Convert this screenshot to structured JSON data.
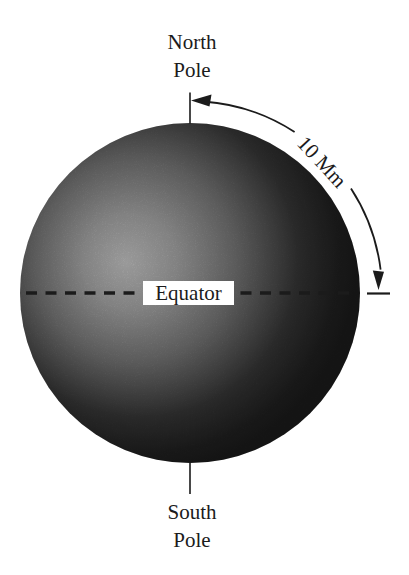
{
  "labels": {
    "north_pole_line1": "North",
    "north_pole_line2": "Pole",
    "south_pole_line1": "South",
    "south_pole_line2": "Pole",
    "equator": "Equator",
    "arc_distance": "10 Mm"
  },
  "colors": {
    "background": "#ffffff",
    "ink": "#1b1b1b",
    "equator_label_box": "#ffffff",
    "sphere_highlight": "#b4b4b4",
    "sphere_mid": "#6a6a6a",
    "sphere_dark": "#181818"
  }
}
